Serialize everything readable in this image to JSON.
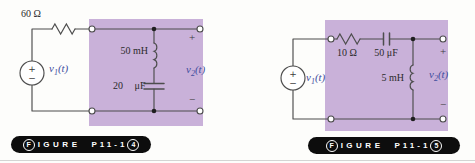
{
  "palette": {
    "purple": "#c9b1d9",
    "wire": "#4d4d4d",
    "label": "#2b2b2b",
    "vblue": "#414e9e",
    "badge_bg": "#0d0d0d",
    "badge_fg": "#ffffff",
    "canvas_bg": "#fdfdfb",
    "rule": "#c6c6c6"
  },
  "figures": [
    {
      "id": "p11-14",
      "badge": {
        "lead": "F",
        "lead_rest": "IGURE",
        "code_main": "P11-1",
        "tail": "4"
      },
      "labels": {
        "resistor": "60 Ω",
        "inductor": "50 mH",
        "cap_value": "20",
        "cap_unit": "μF",
        "input": {
          "base": "v",
          "sub": "1",
          "arg": "(t)"
        },
        "output": {
          "base": "v",
          "sub": "2",
          "arg": "(t)"
        },
        "plus": "+",
        "minus": "−",
        "src_plus": "+",
        "src_minus": "−"
      }
    },
    {
      "id": "p11-15",
      "badge": {
        "lead": "F",
        "lead_rest": "IGURE",
        "code_main": "P11-1",
        "tail": "5"
      },
      "labels": {
        "resistor": "10 Ω",
        "capacitor": "50 μF",
        "inductor": "5 mH",
        "input": {
          "base": "v",
          "sub": "1",
          "arg": "(t)"
        },
        "output": {
          "base": "v",
          "sub": "2",
          "arg": "(t)"
        },
        "plus": "+",
        "minus": "−",
        "src_plus": "+",
        "src_minus": "−"
      }
    }
  ]
}
